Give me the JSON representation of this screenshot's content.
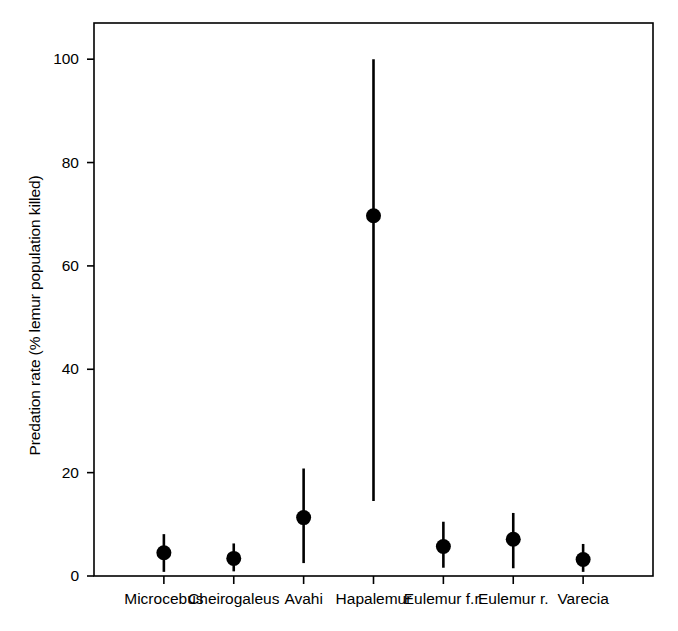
{
  "chart_data": {
    "type": "scatter",
    "title": "",
    "xlabel": "",
    "ylabel": "Predation rate (% lemur population killed)",
    "categories": [
      "Microcebus",
      "Cheirogaleus",
      "Avahi",
      "Hapalemur",
      "Eulemur f.r.",
      "Eulemur r.",
      "Varecia"
    ],
    "values": [
      4.5,
      3.4,
      11.3,
      69.7,
      5.7,
      7.1,
      3.2
    ],
    "error_low": [
      0.8,
      0.9,
      2.5,
      14.5,
      1.6,
      1.5,
      0.8
    ],
    "error_high": [
      8.1,
      6.3,
      20.8,
      100.0,
      10.5,
      12.2,
      6.2
    ],
    "ylim": [
      0,
      107
    ],
    "yticks": [
      0,
      20,
      40,
      60,
      80,
      100
    ],
    "ytick_labels": [
      "0",
      "20",
      "40",
      "60",
      "80",
      "100"
    ],
    "grid": false,
    "legend": "none",
    "marker": "filled-circle",
    "marker_color": "#000000",
    "errorbar_color": "#000000",
    "axis_color": "#000000",
    "background": "#ffffff"
  },
  "axes": {
    "frame_left": 94,
    "frame_right": 653,
    "frame_top": 23,
    "frame_bottom": 576
  }
}
